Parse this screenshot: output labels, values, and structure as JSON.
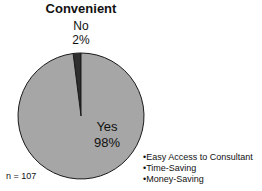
{
  "chart_data": {
    "type": "pie",
    "title": "Convenient",
    "categories": [
      "No",
      "Yes"
    ],
    "values": [
      2,
      98
    ],
    "value_labels": [
      "2%",
      "98%"
    ],
    "colors": [
      "#2e2e2e",
      "#a6a6a6"
    ],
    "sample_size_label": "n = 107",
    "annotations": [
      "•Easy Access to Consultant",
      "•Time-Saving",
      "•Money-Saving"
    ],
    "legend": "none (direct labels)"
  }
}
